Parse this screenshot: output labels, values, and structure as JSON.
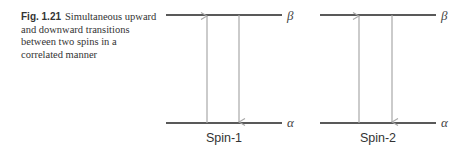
{
  "caption": {
    "label": "Fig. 1.21",
    "text": "Simultaneous upward and downward transitions between two spins in a correlated manner"
  },
  "diagram": {
    "panels": [
      {
        "name": "Spin-1",
        "upper_level": "β",
        "lower_level": "α",
        "transitions": [
          "up",
          "down"
        ]
      },
      {
        "name": "Spin-2",
        "upper_level": "β",
        "lower_level": "α",
        "transitions": [
          "up",
          "down"
        ]
      }
    ],
    "colors": {
      "level": "#222222",
      "arrow": "#a8a8a8"
    }
  }
}
